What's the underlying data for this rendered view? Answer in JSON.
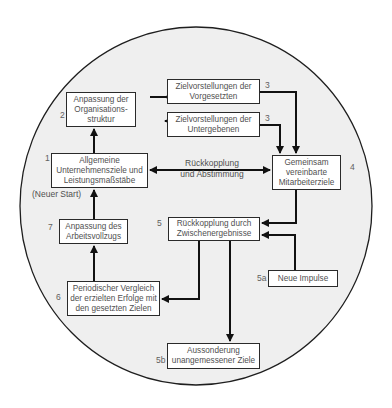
{
  "diagram": {
    "colors": {
      "circle_fill": "#efefef",
      "circle_stroke": "#1e1e1e",
      "box_fill": "#ffffff",
      "arrow": "#111111",
      "text": "#505050"
    },
    "nodes": [
      {
        "id": "n1",
        "number": "1",
        "label": "Allgemeine\nUnternehmensziele und\nLeistungsmaßstäbe"
      },
      {
        "id": "n2",
        "number": "2",
        "label": "Anpassung der\nOrganisations-\nstruktur"
      },
      {
        "id": "n3a",
        "number": "3",
        "label": "Zielvorstellungen der\nVorgesetzten"
      },
      {
        "id": "n3b",
        "number": "3",
        "label": "Zielvorstellungen der\nUntergebenen"
      },
      {
        "id": "n4",
        "number": "4",
        "label": "Gemeinsam\nvereinbarte\nMitarbeiterziele"
      },
      {
        "id": "n5",
        "number": "5",
        "label": "Rückkopplung durch\nZwischenergebnisse"
      },
      {
        "id": "n5a",
        "number": "5a",
        "label": "Neue Impulse"
      },
      {
        "id": "n5b",
        "number": "5b",
        "label": "Aussonderung\nunangemessener Ziele"
      },
      {
        "id": "n6",
        "number": "6",
        "label": "Periodischer Vergleich\nder erzielten Erfolge mit\nden gesetzten Zielen"
      },
      {
        "id": "n7",
        "number": "7",
        "label": "Anpassung des\nArbeitsvollzugs"
      }
    ],
    "edge_labels": {
      "feedback": "Rückkopplung\nund Abstimmung",
      "restart": "(Neuer Start)"
    },
    "edges": [
      {
        "from": "n1",
        "to": "n2"
      },
      {
        "from": "n2",
        "to": "n3a"
      },
      {
        "from": "n2",
        "to": "n3b"
      },
      {
        "from": "n3a",
        "to": "n4"
      },
      {
        "from": "n3b",
        "to": "n4"
      },
      {
        "from": "n1",
        "to": "n4",
        "bidirectional": true,
        "label": "Rückkopplung und Abstimmung"
      },
      {
        "from": "n4",
        "to": "n5"
      },
      {
        "from": "n5a",
        "to": "n5"
      },
      {
        "from": "n5",
        "to": "n6"
      },
      {
        "from": "n5",
        "to": "n5b"
      },
      {
        "from": "n6",
        "to": "n7"
      },
      {
        "from": "n7",
        "to": "n1",
        "label": "(Neuer Start)"
      }
    ]
  }
}
